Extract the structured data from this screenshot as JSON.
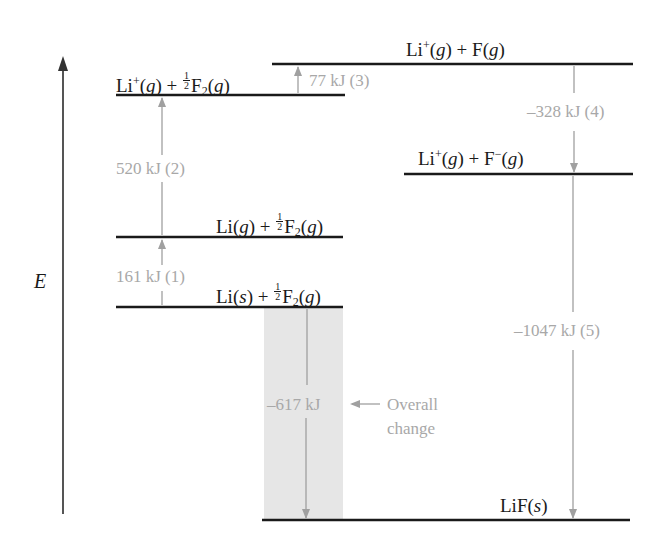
{
  "diagram": {
    "type": "energy-level (Born-Haber cycle) diagram",
    "axis": {
      "label": "E",
      "direction": "up"
    },
    "colors": {
      "level_line": "#1a1a1a",
      "step_arrow": "#a0a0a0",
      "step_text": "#a8a8a8",
      "overall_band": "#e6e6e6"
    },
    "levels": [
      {
        "id": "li_s",
        "species": [
          "Li(s)",
          "½F2(g)"
        ]
      },
      {
        "id": "li_g",
        "species": [
          "Li(g)",
          "½F2(g)"
        ]
      },
      {
        "id": "li_plus",
        "species": [
          "Li+(g)",
          "½F2(g)"
        ]
      },
      {
        "id": "li_plus_f",
        "species": [
          "Li+(g)",
          "F(g)"
        ]
      },
      {
        "id": "li_plus_f_minus",
        "species": [
          "Li+(g)",
          "F−(g)"
        ]
      },
      {
        "id": "lif_s",
        "species": [
          "LiF(s)"
        ]
      }
    ],
    "steps": [
      {
        "number": 1,
        "label": "161 kJ (1)",
        "value_kj": 161,
        "from": "li_s",
        "to": "li_g"
      },
      {
        "number": 2,
        "label": "520 kJ (2)",
        "value_kj": 520,
        "from": "li_g",
        "to": "li_plus"
      },
      {
        "number": 3,
        "label": "77 kJ (3)",
        "value_kj": 77,
        "from": "li_plus",
        "to": "li_plus_f"
      },
      {
        "number": 4,
        "label": "–328 kJ (4)",
        "value_kj": -328,
        "from": "li_plus_f",
        "to": "li_plus_f_minus"
      },
      {
        "number": 5,
        "label": "–1047 kJ (5)",
        "value_kj": -1047,
        "from": "li_plus_f_minus",
        "to": "lif_s"
      }
    ],
    "overall": {
      "label": "–617 kJ",
      "value_kj": -617,
      "annotation_line1": "Overall",
      "annotation_line2": "change",
      "from": "li_s",
      "to": "lif_s"
    }
  },
  "text": {
    "axis_e": "E",
    "li": "Li",
    "lif": "LiF",
    "f": "F",
    "plus": "+",
    "minus": "−",
    "g": "g",
    "s": "s",
    "two": "2",
    "one": "1",
    "open": "(",
    "close": ")",
    "step1": "161 kJ (1)",
    "step2": "520 kJ (2)",
    "step3": "77 kJ (3)",
    "step4": "–328 kJ (4)",
    "step5": "–1047 kJ (5)",
    "overall_value": "–617 kJ",
    "overall_l1": "Overall",
    "overall_l2": "change"
  }
}
